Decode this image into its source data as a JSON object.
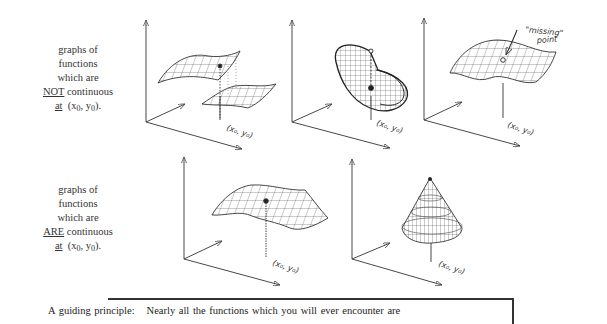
{
  "rows": [
    {
      "caption": {
        "line1": "graphs of",
        "line2": "functions",
        "line3": "which are",
        "emphasis": "NOT",
        "line4_rest": "continuous",
        "line5_at": "at",
        "point_x": "x",
        "point_y": "y",
        "subscript": "0",
        "open": "(",
        "comma": ",",
        "close": ")."
      },
      "graphs": [
        {
          "label": "(x0, y0)",
          "type": "jump-discontinuity-surface"
        },
        {
          "label": "(x0, y0)",
          "type": "spiral-discontinuity-surface"
        },
        {
          "label": "(x0, y0)",
          "type": "surface-with-missing-point",
          "annotation_line1": "\"missing\"",
          "annotation_line2": "point"
        }
      ]
    },
    {
      "caption": {
        "line1": "graphs of",
        "line2": "functions",
        "line3": "which are",
        "emphasis": "ARE",
        "line4_rest": "continuous",
        "line5_at": "at",
        "point_x": "x",
        "point_y": "y",
        "subscript": "0",
        "open": "(",
        "comma": ",",
        "close": ")."
      },
      "graphs": [
        {
          "label": "(x0, y0)",
          "type": "smooth-saddle-surface"
        },
        {
          "label": "(x0, y0)",
          "type": "cone-surface"
        }
      ]
    }
  ],
  "principle": {
    "lead": "A guiding principle:",
    "text": "Nearly all the functions which you will ever encounter are"
  },
  "labels": {
    "xy0": "(x₀, y₀)"
  }
}
